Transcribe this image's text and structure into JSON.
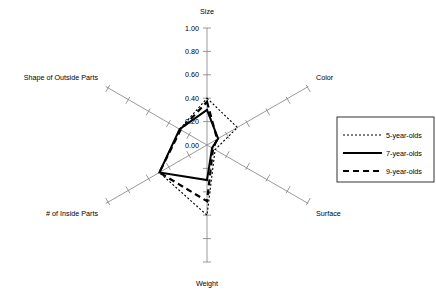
{
  "chart_data": {
    "type": "radar",
    "title": "",
    "categories": [
      "Size",
      "Color",
      "Surface",
      "Weight",
      "# of Inside Parts",
      "Shape of Outside Parts"
    ],
    "radial_ticks": [
      "0.00",
      "0.20",
      "0.40",
      "0.60",
      "0.80",
      "1.00"
    ],
    "rlim": [
      0.0,
      1.0
    ],
    "rlabel": "",
    "grid": false,
    "legend_position": "right",
    "series": [
      {
        "name": "5-year-olds",
        "style": "dotted",
        "values": [
          0.4,
          0.3,
          0.08,
          0.6,
          0.47,
          0.27
        ]
      },
      {
        "name": "7-year-olds",
        "style": "solid",
        "values": [
          0.3,
          0.11,
          0.05,
          0.3,
          0.47,
          0.27
        ]
      },
      {
        "name": "9-year-olds",
        "style": "dashed",
        "values": [
          0.37,
          0.1,
          0.06,
          0.48,
          0.47,
          0.26
        ]
      }
    ]
  },
  "axis_labels": {
    "size": "Size",
    "color": "Color",
    "surface": "Surface",
    "weight": "Weight",
    "inside_parts": "# of Inside Parts",
    "outside_parts": "Shape of Outside Parts"
  },
  "tick_labels": {
    "t000": "0.00",
    "t020": "0.20",
    "t040": "0.40",
    "t060": "0.60",
    "t080": "0.80",
    "t100": "1.00"
  },
  "legend": {
    "items": [
      {
        "label": "5-year-olds"
      },
      {
        "label": "7-year-olds"
      },
      {
        "label": "9-year-olds"
      }
    ]
  },
  "colors": {
    "axis": "#808080",
    "series": "#000000",
    "background": "#ffffff",
    "legend_border": "#000000"
  }
}
